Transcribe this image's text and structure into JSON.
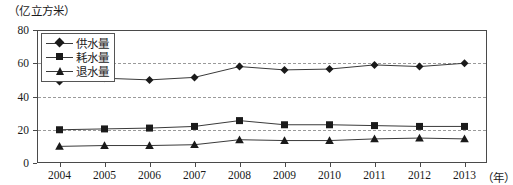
{
  "unit_label": "（亿立方米）",
  "legend": {
    "position": "top-left-inside",
    "items": [
      {
        "label": "供水量",
        "marker": "diamond-marker-icon"
      },
      {
        "label": "耗水量",
        "marker": "square-marker-icon"
      },
      {
        "label": "退水量",
        "marker": "triangle-marker-icon"
      }
    ]
  },
  "axes": {
    "y_ticks": [
      "0",
      "20",
      "40",
      "60",
      "80"
    ],
    "x_ticks": [
      "2004",
      "2005",
      "2006",
      "2007",
      "2008",
      "2009",
      "2010",
      "2011",
      "2012",
      "2013"
    ],
    "x_unit": "（年）"
  },
  "chart_data": {
    "type": "line",
    "title": "",
    "subtitle": "",
    "xlabel": "年",
    "ylabel": "亿立方米",
    "ylim": [
      0,
      80
    ],
    "yticks": [
      0,
      20,
      40,
      60,
      80
    ],
    "grid": true,
    "legend_position": "upper left",
    "categories": [
      "2004",
      "2005",
      "2006",
      "2007",
      "2008",
      "2009",
      "2010",
      "2011",
      "2012",
      "2013"
    ],
    "series": [
      {
        "name": "供水量",
        "marker": "diamond",
        "values": [
          49,
          51,
          50,
          51.5,
          58,
          56,
          56.5,
          59,
          58,
          60
        ]
      },
      {
        "name": "耗水量",
        "marker": "square",
        "values": [
          20,
          20.5,
          21,
          22,
          25.5,
          23,
          23,
          22.5,
          22,
          22
        ]
      },
      {
        "name": "退水量",
        "marker": "triangle",
        "values": [
          10,
          10.5,
          10.5,
          11,
          14,
          13.5,
          13.5,
          14.5,
          15,
          14.5
        ]
      }
    ]
  }
}
